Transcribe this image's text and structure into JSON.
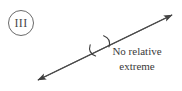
{
  "figure": {
    "background_color": "#ffffff",
    "ink_color": "#4b4b4b",
    "text_color": "#3a3a3a",
    "badge": {
      "label": "III",
      "shape": "circle",
      "center_x": 21,
      "center_y": 23,
      "radius": 12.5,
      "stroke_color": "#6a6a6a"
    },
    "axis": {
      "kind": "double-headed-arrow",
      "x1": 38,
      "y1": 80,
      "x2": 172,
      "y2": 15,
      "stroke_color": "#4b4b4b",
      "stroke_width": 1.1,
      "arrowheads": [
        "start",
        "end"
      ]
    },
    "marks": [
      {
        "name": "arc-lower-left",
        "glyph": "(",
        "x": 90,
        "y": 52,
        "rotation_deg": -26
      },
      {
        "name": "arc-upper-right",
        "glyph": ")",
        "x": 109,
        "y": 40,
        "rotation_deg": -26
      }
    ],
    "annotation": {
      "line1": "No relative",
      "line2": "extreme",
      "x": 137,
      "y1": 55,
      "y2": 70,
      "font_size": 11,
      "anchor": "middle"
    }
  }
}
